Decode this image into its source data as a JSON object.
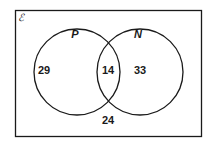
{
  "diagram": {
    "type": "venn",
    "universal_set": {
      "symbol": "ℰ",
      "region_outside_value": "24"
    },
    "sets": [
      {
        "name": "P",
        "only_value": "29"
      },
      {
        "name": "N",
        "only_value": "33"
      }
    ],
    "intersection": {
      "sets": [
        "P",
        "N"
      ],
      "value": "14"
    },
    "colors": {
      "stroke": "#1a1a1a",
      "background": "#ffffff"
    }
  }
}
